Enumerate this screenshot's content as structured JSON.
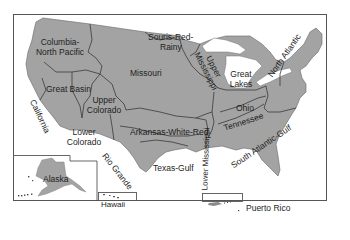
{
  "map": {
    "title": "Water Resource Regions",
    "colors": {
      "land": "#a3a3a3",
      "water": "#ffffff",
      "border": "#3a3a3a",
      "frame": "#555555"
    },
    "regions": [
      {
        "id": "columbia-north-pacific",
        "label_line1": "Columbia-",
        "label_line2": "North Pacific"
      },
      {
        "id": "souris-red-rainy",
        "label_line1": "Souris-Red-",
        "label_line2": "Rainy"
      },
      {
        "id": "missouri",
        "label": "Missouri"
      },
      {
        "id": "upper-mississippi",
        "label_line1": "Upper",
        "label_line2": "Mississippi"
      },
      {
        "id": "great-lakes",
        "label_line1": "Great",
        "label_line2": "Lakes"
      },
      {
        "id": "north-atlantic",
        "label": "North Atlantic"
      },
      {
        "id": "great-basin",
        "label": "Great Basin"
      },
      {
        "id": "upper-colorado",
        "label_line1": "Upper",
        "label_line2": "Colorado"
      },
      {
        "id": "california",
        "label": "California"
      },
      {
        "id": "ohio",
        "label": "Ohio"
      },
      {
        "id": "tennessee",
        "label": "Tennessee"
      },
      {
        "id": "lower-colorado",
        "label_line1": "Lower",
        "label_line2": "Colorado"
      },
      {
        "id": "arkansas-white-red",
        "label": "Arkansas-White-Red"
      },
      {
        "id": "rio-grande",
        "label": "Rio Grande"
      },
      {
        "id": "lower-mississippi",
        "label": "Lower Mississippi"
      },
      {
        "id": "south-atlantic-gulf",
        "label": "South Atlantic-Gulf"
      },
      {
        "id": "texas-gulf",
        "label": "Texas-Gulf"
      }
    ],
    "insets": {
      "alaska": "Alaska",
      "hawaii": "Hawaii",
      "puerto_rico": "Puerto Rico"
    }
  }
}
